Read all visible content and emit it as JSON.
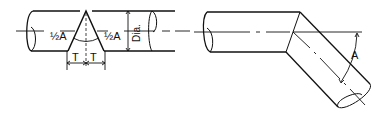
{
  "diagram": {
    "left_view": {
      "labels": {
        "half_angle_left": "½A",
        "half_angle_right": "½A",
        "diameter": "Dia.",
        "t_left": "T",
        "t_right": "T"
      }
    },
    "right_view": {
      "labels": {
        "angle": "A"
      }
    },
    "colors": {
      "line": "#111111",
      "background": "#ffffff"
    }
  }
}
